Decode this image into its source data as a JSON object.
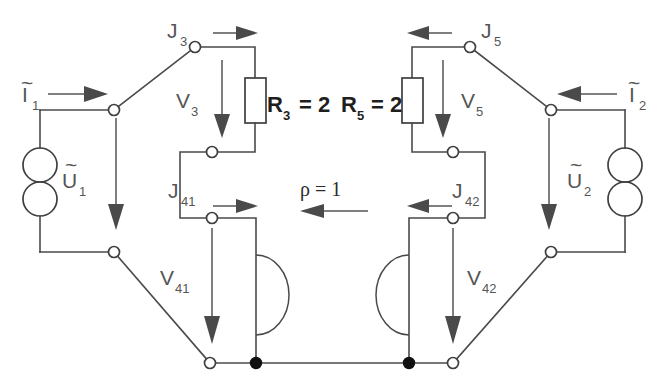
{
  "figure": {
    "background_color": "#ffffff",
    "wire_color": "#4a4a4a",
    "label_color": "#555555",
    "component_label_color": "#1f1f1f"
  },
  "labels": {
    "current_left": "I",
    "current_left_sub": "1",
    "current_right": "I",
    "current_right_sub": "2",
    "voltage_left": "U",
    "voltage_left_sub": "1",
    "voltage_right": "U",
    "voltage_right_sub": "2",
    "j3": "J",
    "j3_sub": "3",
    "j5": "J",
    "j5_sub": "5",
    "j41": "J",
    "j41_sub": "41",
    "j42": "J",
    "j42_sub": "42",
    "v3": "V",
    "v3_sub": "3",
    "v5": "V",
    "v5_sub": "5",
    "v41": "V",
    "v41_sub": "41",
    "v42": "V",
    "v42_sub": "42",
    "r3": "R",
    "r3_sub": "3",
    "r3_value": "= 2",
    "r5": "R",
    "r5_sub": "5",
    "r5_value": "= 2",
    "rho": "ρ = 1"
  },
  "components": {
    "source_left": {
      "name": "U1-source",
      "type": "two-circle-source"
    },
    "source_right": {
      "name": "U2-source",
      "type": "two-circle-source"
    },
    "resistor_r3": {
      "name": "R3",
      "value": "2"
    },
    "resistor_r5": {
      "name": "R5",
      "value": "2"
    },
    "coupling_left": {
      "name": "coupling-left",
      "type": "semicircle"
    },
    "coupling_right": {
      "name": "coupling-right",
      "type": "semicircle"
    }
  },
  "nodes": [
    {
      "name": "node-top-left-terminal",
      "x": 114,
      "y": 110,
      "kind": "open"
    },
    {
      "name": "node-j3",
      "x": 195,
      "y": 47,
      "kind": "open"
    },
    {
      "name": "node-mid-left-upper",
      "x": 212,
      "y": 152,
      "kind": "open"
    },
    {
      "name": "node-j41",
      "x": 212,
      "y": 218,
      "kind": "open"
    },
    {
      "name": "node-bottom-left-terminal",
      "x": 114,
      "y": 252,
      "kind": "open"
    },
    {
      "name": "node-bottom-left-rail",
      "x": 210,
      "y": 363,
      "kind": "open"
    },
    {
      "name": "node-ground-left",
      "x": 256,
      "y": 363,
      "kind": "filled"
    },
    {
      "name": "node-ground-right",
      "x": 409,
      "y": 363,
      "kind": "filled"
    },
    {
      "name": "node-bottom-right-rail",
      "x": 453,
      "y": 363,
      "kind": "open"
    },
    {
      "name": "node-bottom-right-terminal",
      "x": 551,
      "y": 252,
      "kind": "open"
    },
    {
      "name": "node-j42",
      "x": 453,
      "y": 218,
      "kind": "open"
    },
    {
      "name": "node-mid-right-upper",
      "x": 453,
      "y": 152,
      "kind": "open"
    },
    {
      "name": "node-j5",
      "x": 470,
      "y": 47,
      "kind": "open"
    },
    {
      "name": "node-top-right-terminal",
      "x": 551,
      "y": 110,
      "kind": "open"
    }
  ]
}
